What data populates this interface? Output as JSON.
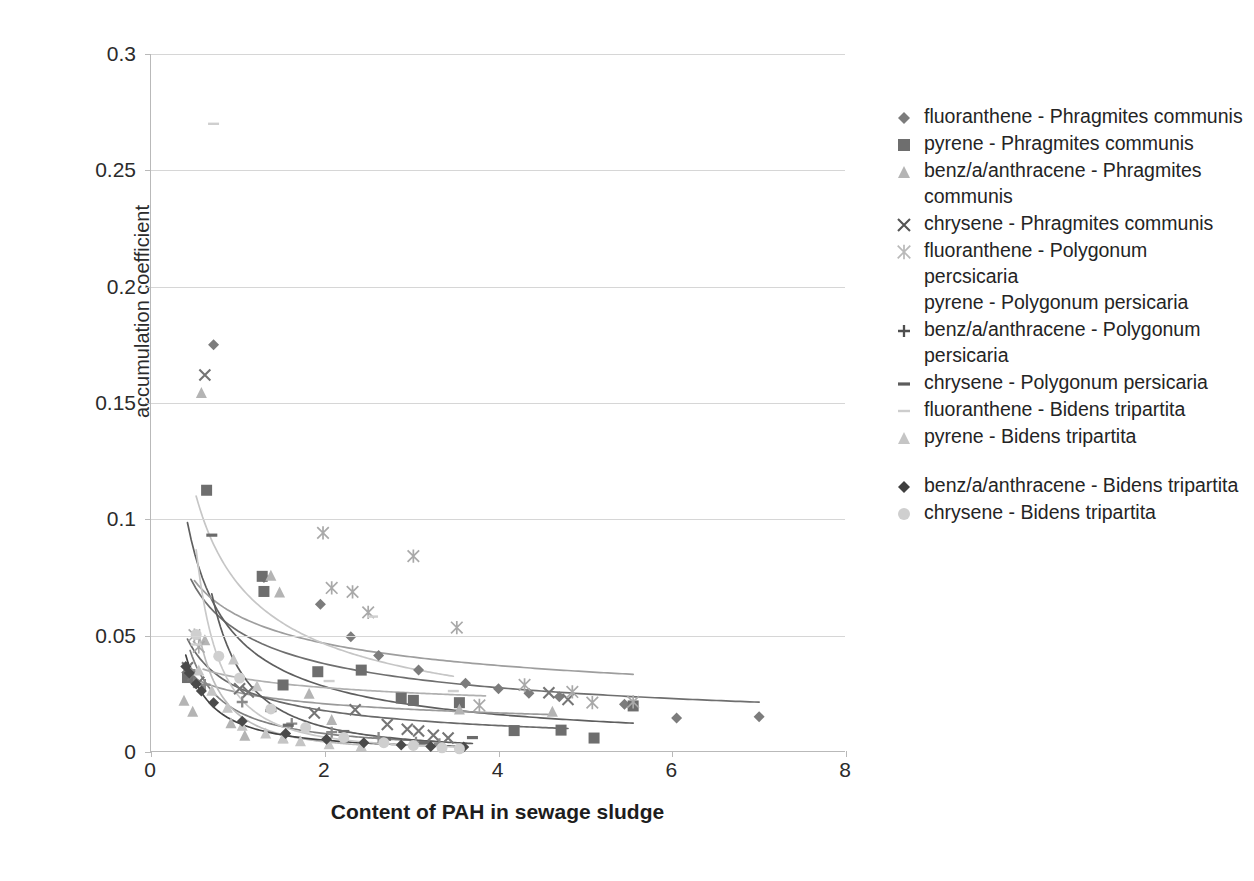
{
  "chart_data": {
    "type": "scatter",
    "title": "",
    "xlabel": "Content of PAH in sewage sludge",
    "ylabel": "accumulation coefficient",
    "xlim": [
      0,
      8
    ],
    "ylim": [
      0,
      0.3
    ],
    "x_ticks": [
      0,
      2,
      4,
      6,
      8
    ],
    "x_tick_labels": [
      "0",
      "2",
      "4",
      "6",
      "8"
    ],
    "y_ticks": [
      0,
      0.05,
      0.1,
      0.15,
      0.2,
      0.25,
      0.3
    ],
    "y_tick_labels": [
      "0",
      "0.05",
      "0.1",
      "0.15",
      "0.2",
      "0.25",
      "0.3"
    ],
    "grid": "horizontal",
    "legend_position": "right",
    "series": [
      {
        "name": "fluoranthene - Phragmites communis",
        "marker": "diamond",
        "color": "#7c7c7c",
        "trendline": true,
        "trend_color": "#6f6f6f",
        "points": [
          [
            0.72,
            0.175
          ],
          [
            1.3,
            0.075
          ],
          [
            1.95,
            0.0635
          ],
          [
            2.3,
            0.0495
          ],
          [
            2.62,
            0.0415
          ],
          [
            3.08,
            0.0352
          ],
          [
            3.62,
            0.0295
          ],
          [
            4.0,
            0.0272
          ],
          [
            4.35,
            0.0252
          ],
          [
            4.7,
            0.0238
          ],
          [
            5.45,
            0.0205
          ],
          [
            6.05,
            0.0146
          ],
          [
            7.0,
            0.0152
          ],
          [
            0.46,
            0.0342
          ],
          [
            0.5,
            0.03
          ]
        ]
      },
      {
        "name": "pyrene - Phragmites communis",
        "marker": "square",
        "color": "#6e6e6e",
        "trendline": true,
        "trend_color": "#5f5f5f",
        "points": [
          [
            0.64,
            0.1125
          ],
          [
            1.28,
            0.0755
          ],
          [
            1.3,
            0.069
          ],
          [
            1.52,
            0.0288
          ],
          [
            1.92,
            0.0345
          ],
          [
            2.42,
            0.0352
          ],
          [
            2.88,
            0.0232
          ],
          [
            3.02,
            0.0222
          ],
          [
            3.55,
            0.0212
          ],
          [
            4.18,
            0.0092
          ],
          [
            4.72,
            0.0094
          ],
          [
            5.1,
            0.006
          ],
          [
            5.55,
            0.0198
          ],
          [
            0.42,
            0.032
          ]
        ]
      },
      {
        "name": "benz/a/anthracene - Phragmites communis",
        "marker": "triangle",
        "color": "#b4b4b4",
        "trendline": true,
        "trend_color": "#9a9a9a",
        "points": [
          [
            0.58,
            0.1545
          ],
          [
            1.38,
            0.076
          ],
          [
            1.48,
            0.0688
          ],
          [
            1.82,
            0.0252
          ],
          [
            2.08,
            0.014
          ],
          [
            0.38,
            0.0222
          ],
          [
            0.48,
            0.0175
          ],
          [
            0.92,
            0.0126
          ],
          [
            1.08,
            0.0072
          ],
          [
            1.52,
            0.006
          ],
          [
            3.55,
            0.0185
          ],
          [
            4.62,
            0.0175
          ],
          [
            0.62,
            0.0482
          ]
        ]
      },
      {
        "name": "chrysene - Phragmites communis",
        "marker": "x",
        "color": "#757575",
        "trendline": true,
        "trend_color": "#6a6a6a",
        "points": [
          [
            0.62,
            0.162
          ],
          [
            0.42,
            0.0362
          ],
          [
            0.48,
            0.033
          ],
          [
            0.55,
            0.03
          ],
          [
            1.02,
            0.0272
          ],
          [
            1.12,
            0.0258
          ],
          [
            1.88,
            0.0168
          ],
          [
            2.35,
            0.0182
          ],
          [
            2.72,
            0.0118
          ],
          [
            2.95,
            0.0098
          ],
          [
            3.08,
            0.009
          ],
          [
            3.25,
            0.0072
          ],
          [
            3.42,
            0.006
          ],
          [
            4.58,
            0.0255
          ],
          [
            4.8,
            0.0226
          ]
        ]
      },
      {
        "name": "fluoranthene - Polygonum percsicaria",
        "marker": "asterisk",
        "color": "#a9a9a9",
        "trendline": true,
        "trend_color": "#9e9e9e",
        "points": [
          [
            1.98,
            0.0942
          ],
          [
            3.02,
            0.0842
          ],
          [
            2.5,
            0.06
          ],
          [
            3.52,
            0.0535
          ],
          [
            2.08,
            0.0705
          ],
          [
            2.32,
            0.0688
          ],
          [
            4.3,
            0.0288
          ],
          [
            4.85,
            0.0258
          ],
          [
            5.08,
            0.0212
          ],
          [
            5.55,
            0.0215
          ],
          [
            3.78,
            0.02
          ],
          [
            0.5,
            0.0502
          ],
          [
            0.55,
            0.0452
          ]
        ]
      },
      {
        "name": "pyrene - Polygonum persicaria",
        "marker": "none",
        "color": "#bdbdbd",
        "trendline": true,
        "trend_color": "#b0b0b0",
        "points": [
          [
            2.42,
            0.0452
          ],
          [
            3.18,
            0.0262
          ],
          [
            3.85,
            0.0175
          ],
          [
            0.6,
            0.038
          ],
          [
            1.18,
            0.0225
          ]
        ]
      },
      {
        "name": "benz/a/anthracene - Polygonum persicaria",
        "marker": "plus",
        "color": "#8a8a8a",
        "trendline": true,
        "trend_color": "#808080",
        "points": [
          [
            0.45,
            0.0352
          ],
          [
            0.62,
            0.029
          ],
          [
            1.05,
            0.0215
          ],
          [
            1.62,
            0.0122
          ],
          [
            2.08,
            0.0085
          ],
          [
            2.62,
            0.0062
          ],
          [
            3.05,
            0.0042
          ],
          [
            3.32,
            0.0035
          ]
        ]
      },
      {
        "name": "chrysene - Polygonum persicaria",
        "marker": "dash",
        "color": "#6b6b6b",
        "trendline": true,
        "trend_color": "#5c5c5c",
        "points": [
          [
            0.7,
            0.0932
          ],
          [
            1.38,
            0.0178
          ],
          [
            1.58,
            0.0115
          ],
          [
            2.22,
            0.0088
          ],
          [
            2.7,
            0.0055
          ],
          [
            3.15,
            0.004
          ],
          [
            3.7,
            0.0062
          ]
        ]
      },
      {
        "name": "fluoranthene - Bidens tripartita",
        "marker": "hline",
        "color": "#cfcfcf",
        "trendline": true,
        "trend_color": "#c6c6c6",
        "points": [
          [
            0.72,
            0.27
          ],
          [
            2.55,
            0.0582
          ],
          [
            3.48,
            0.0262
          ],
          [
            2.05,
            0.0305
          ],
          [
            0.52,
            0.0462
          ]
        ]
      },
      {
        "name": "pyrene - Bidens tripartita",
        "marker": "triangle-light",
        "color": "#c5c5c5",
        "trendline": true,
        "trend_color": "#bcbcbc",
        "points": [
          [
            0.55,
            0.0352
          ],
          [
            0.7,
            0.0265
          ],
          [
            0.88,
            0.0192
          ],
          [
            1.05,
            0.0115
          ],
          [
            1.32,
            0.0082
          ],
          [
            1.52,
            0.0062
          ],
          [
            1.72,
            0.0048
          ],
          [
            2.05,
            0.0035
          ],
          [
            2.42,
            0.0028
          ],
          [
            0.95,
            0.04
          ],
          [
            1.22,
            0.0285
          ]
        ]
      },
      {
        "name": "benz/a/anthracene - Bidens tripartita",
        "marker": "diamond-dark",
        "color": "#4a4a4a",
        "trendline": true,
        "trend_color": "#444444",
        "points": [
          [
            0.4,
            0.0368
          ],
          [
            0.44,
            0.034
          ],
          [
            0.52,
            0.0292
          ],
          [
            0.58,
            0.0262
          ],
          [
            0.72,
            0.0212
          ],
          [
            1.05,
            0.0132
          ],
          [
            1.55,
            0.008
          ],
          [
            2.02,
            0.0055
          ],
          [
            2.45,
            0.004
          ],
          [
            2.88,
            0.003
          ],
          [
            3.22,
            0.0024
          ],
          [
            3.6,
            0.0022
          ]
        ]
      },
      {
        "name": "chrysene - Bidens tripartita",
        "marker": "circle",
        "color": "#cfcfcf",
        "trendline": true,
        "trend_color": "#c9c9c9",
        "points": [
          [
            0.52,
            0.0505
          ],
          [
            0.78,
            0.0412
          ],
          [
            1.02,
            0.0318
          ],
          [
            1.38,
            0.0185
          ],
          [
            1.78,
            0.0105
          ],
          [
            2.22,
            0.0062
          ],
          [
            2.68,
            0.004
          ],
          [
            3.02,
            0.0028
          ],
          [
            3.35,
            0.0018
          ],
          [
            3.55,
            0.0014
          ]
        ]
      }
    ]
  },
  "axes": {
    "y_title": "accumulation coefficient",
    "x_title": "Content of PAH in sewage sludge",
    "y_tick_labels": [
      "0.3",
      "0.25",
      "0.2",
      "0.15",
      "0.1",
      "0.05",
      "0"
    ],
    "x_tick_labels": [
      "0",
      "2",
      "4",
      "6",
      "8"
    ]
  },
  "legend": {
    "items": [
      {
        "label": "fluoranthene - Phragmites communis",
        "marker": "diamond",
        "color": "#7c7c7c"
      },
      {
        "label": "pyrene - Phragmites communis",
        "marker": "square",
        "color": "#6e6e6e"
      },
      {
        "label": "benz/a/anthracene - Phragmites communis",
        "marker": "triangle",
        "color": "#b4b4b4"
      },
      {
        "label": "chrysene - Phragmites communis",
        "marker": "x",
        "color": "#555555"
      },
      {
        "label": "fluoranthene - Polygonum percsicaria",
        "marker": "asterisk",
        "color": "#b9b9b9"
      },
      {
        "label": "pyrene - Polygonum persicaria",
        "marker": "none",
        "color": "#bdbdbd"
      },
      {
        "label": "benz/a/anthracene - Polygonum persicaria",
        "marker": "plus",
        "color": "#4f4f4f"
      },
      {
        "label": "chrysene - Polygonum persicaria",
        "marker": "dash",
        "color": "#5c5c5c"
      },
      {
        "label": "fluoranthene - Bidens tripartita",
        "marker": "hline",
        "color": "#cdcdcd"
      },
      {
        "label": "pyrene - Bidens tripartita",
        "marker": "triangle-light",
        "color": "#c5c5c5"
      },
      {
        "label": "",
        "marker": "spacer",
        "color": "#ffffff"
      },
      {
        "label": "benz/a/anthracene - Bidens tripartita",
        "marker": "diamond-dark",
        "color": "#3f3f3f"
      },
      {
        "label": "chrysene - Bidens tripartita",
        "marker": "circle",
        "color": "#cfcfcf"
      }
    ]
  }
}
